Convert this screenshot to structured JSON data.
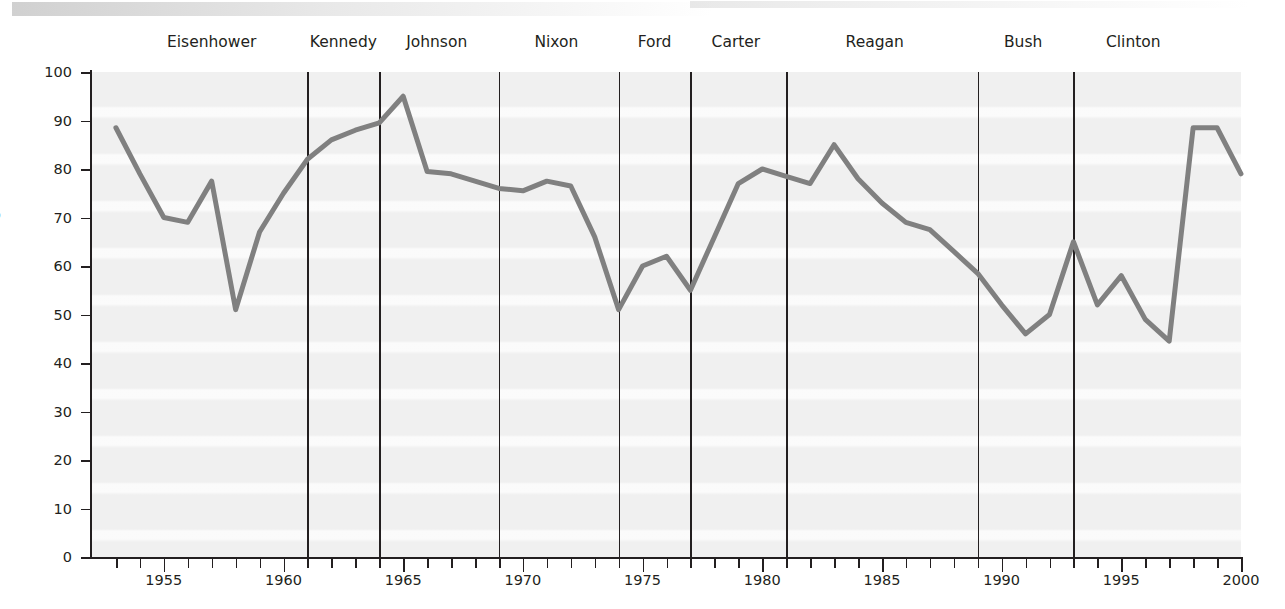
{
  "chart_data": {
    "type": "line",
    "title": "",
    "subtitle": "",
    "xlabel": "",
    "ylabel": "Percentage",
    "xlim": [
      1952,
      2000
    ],
    "ylim": [
      0,
      100
    ],
    "grid": false,
    "legend": "none",
    "y_ticks": [
      0,
      10,
      20,
      30,
      40,
      50,
      60,
      70,
      80,
      90,
      100
    ],
    "x_ticks": [
      1953,
      1954,
      1955,
      1956,
      1957,
      1958,
      1959,
      1960,
      1961,
      1962,
      1963,
      1964,
      1965,
      1966,
      1967,
      1968,
      1969,
      1970,
      1971,
      1972,
      1973,
      1974,
      1975,
      1976,
      1977,
      1978,
      1979,
      1980,
      1981,
      1982,
      1983,
      1984,
      1985,
      1986,
      1987,
      1988,
      1989,
      1990,
      1991,
      1992,
      1993,
      1994,
      1995,
      1996,
      1997,
      1998,
      1999,
      2000
    ],
    "x_tick_labels": [
      "1955",
      "1960",
      "1965",
      "1970",
      "1975",
      "1980",
      "1985",
      "1990",
      "1995",
      "2000"
    ],
    "x_tick_label_values": [
      1955,
      1960,
      1965,
      1970,
      1975,
      1980,
      1985,
      1990,
      1995,
      2000
    ],
    "series": [
      {
        "name": "Percentage",
        "color": "#808080",
        "x": [
          1953,
          1954,
          1955,
          1956,
          1957,
          1958,
          1959,
          1960,
          1961,
          1962,
          1963,
          1964,
          1965,
          1966,
          1967,
          1968,
          1969,
          1970,
          1971,
          1972,
          1973,
          1974,
          1975,
          1976,
          1977,
          1978,
          1979,
          1980,
          1981,
          1982,
          1983,
          1984,
          1985,
          1986,
          1987,
          1988,
          1989,
          1990,
          1991,
          1992,
          1993,
          1994,
          1995,
          1996,
          1997,
          1998,
          1999,
          2000
        ],
        "values": [
          88.5,
          79,
          70,
          69,
          77.5,
          51,
          67,
          75,
          82,
          86,
          88,
          89.5,
          95,
          79.5,
          79,
          77.5,
          76,
          75.5,
          77.5,
          76.5,
          66,
          51,
          60,
          62,
          55,
          66,
          77,
          80,
          78.5,
          77,
          85,
          78,
          73,
          69,
          67.5,
          63,
          58.5,
          52,
          46,
          50,
          65,
          52,
          58,
          49,
          44.5,
          88.5,
          88.5,
          79
        ]
      }
    ],
    "annotations": {
      "presidents": [
        {
          "name": "Eisenhower",
          "start": 1953,
          "end": 1961,
          "label_year": 1957
        },
        {
          "name": "Kennedy",
          "start": 1961,
          "end": 1964,
          "label_year": 1962.5
        },
        {
          "name": "Johnson",
          "start": 1964,
          "end": 1969,
          "label_year": 1966.4
        },
        {
          "name": "Nixon",
          "start": 1969,
          "end": 1974,
          "label_year": 1971.4
        },
        {
          "name": "Ford",
          "start": 1974,
          "end": 1977,
          "label_year": 1975.5
        },
        {
          "name": "Carter",
          "start": 1977,
          "end": 1981,
          "label_year": 1978.9
        },
        {
          "name": "Reagan",
          "start": 1981,
          "end": 1989,
          "label_year": 1984.7
        },
        {
          "name": "Bush",
          "start": 1989,
          "end": 1993,
          "label_year": 1990.9
        },
        {
          "name": "Clinton",
          "start": 1993,
          "end": 2000,
          "label_year": 1995.5
        }
      ],
      "divider_years": [
        1961,
        1964,
        1969,
        1974,
        1977,
        1981,
        1989,
        1993
      ]
    },
    "style": {
      "plot_background": "#f0f0f0",
      "line_color": "#808080",
      "axis_color": "#231f20",
      "line_width": 5
    }
  }
}
